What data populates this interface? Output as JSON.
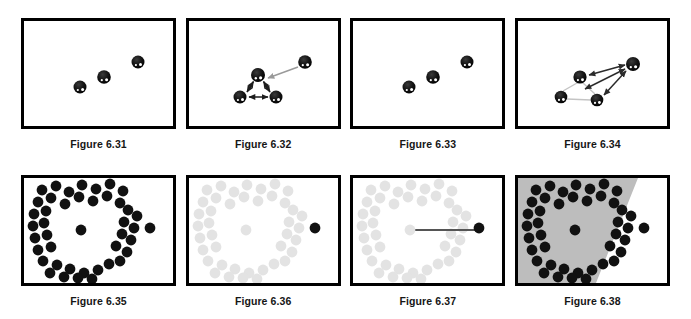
{
  "sheet": {
    "title": "Figures 6.31-6.38 sphere diagrams",
    "background_color": "#ffffff",
    "border_color": "#000000",
    "ball_color": "#111111",
    "faded_ball_color": "#e3e3e3",
    "gray_arrow_color": "#9a9a9a",
    "dark_arrow_color": "#2b2b2b",
    "shade_region_color": "#bdbdbd"
  },
  "rows": [
    {
      "name": "top-row",
      "panels": [
        {
          "id": "fig-631",
          "caption": "Figure 6.31",
          "description": "Three black spheres scattered, no connections",
          "balls": [
            {
              "cx": 56,
              "cy": 66,
              "r": 6.5,
              "shade": "dark"
            },
            {
              "cx": 80,
              "cy": 56,
              "r": 6.8,
              "shade": "dark"
            },
            {
              "cx": 114,
              "cy": 41,
              "r": 6.5,
              "shade": "dark"
            }
          ],
          "arrows": [],
          "lines": [],
          "shade_polygon": null
        },
        {
          "id": "fig-632",
          "caption": "Figure 6.32",
          "description": "Three spheres joined by double-headed arrows forming a triangle, a fourth sphere at upper right with a gray arrow pointing toward the triangle apex",
          "balls": [
            {
              "cx": 51,
              "cy": 76,
              "r": 6.5,
              "shade": "dark"
            },
            {
              "cx": 87,
              "cy": 76,
              "r": 6.5,
              "shade": "dark"
            },
            {
              "cx": 69,
              "cy": 54,
              "r": 7.0,
              "shade": "dark"
            },
            {
              "cx": 116,
              "cy": 41,
              "r": 6.8,
              "shade": "dark"
            }
          ],
          "arrows": [
            {
              "x1": 60,
              "y1": 76,
              "x2": 79,
              "y2": 76,
              "style": "double",
              "color": "dark"
            },
            {
              "x1": 58,
              "y1": 70,
              "x2": 64,
              "y2": 60,
              "style": "double",
              "color": "dark"
            },
            {
              "x1": 75,
              "y1": 60,
              "x2": 81,
              "y2": 70,
              "style": "double",
              "color": "dark"
            },
            {
              "x1": 109,
              "y1": 46,
              "x2": 79,
              "y2": 57,
              "style": "single",
              "color": "gray"
            }
          ],
          "lines": [],
          "shade_polygon": null
        },
        {
          "id": "fig-633",
          "caption": "Figure 6.33",
          "description": "Three black spheres scattered, no connections (same layout as 6.31)",
          "balls": [
            {
              "cx": 56,
              "cy": 66,
              "r": 6.5,
              "shade": "dark"
            },
            {
              "cx": 80,
              "cy": 56,
              "r": 6.8,
              "shade": "dark"
            },
            {
              "cx": 114,
              "cy": 41,
              "r": 6.5,
              "shade": "dark"
            }
          ],
          "arrows": [],
          "lines": [],
          "shade_polygon": null
        },
        {
          "id": "fig-634",
          "caption": "Figure 6.34",
          "description": "Four spheres: a light-gray triangle of three plus an upper-right sphere, with dark double-headed arrows from the upper-right sphere to each triangle member",
          "balls": [
            {
              "cx": 43,
              "cy": 76,
              "r": 6.3,
              "shade": "dark"
            },
            {
              "cx": 79,
              "cy": 79,
              "r": 6.3,
              "shade": "dark"
            },
            {
              "cx": 62,
              "cy": 56,
              "r": 6.6,
              "shade": "dark"
            },
            {
              "cx": 115,
              "cy": 43,
              "r": 7.0,
              "shade": "dark"
            }
          ],
          "arrows": [
            {
              "x1": 71,
              "y1": 54,
              "x2": 107,
              "y2": 44,
              "style": "double",
              "color": "dark"
            },
            {
              "x1": 67,
              "y1": 68,
              "x2": 107,
              "y2": 48,
              "style": "double",
              "color": "dark"
            },
            {
              "x1": 86,
              "y1": 74,
              "x2": 108,
              "y2": 50,
              "style": "double",
              "color": "dark"
            }
          ],
          "lines": [
            {
              "x1": 45,
              "y1": 70,
              "x2": 59,
              "y2": 62,
              "color": "gray"
            },
            {
              "x1": 49,
              "y1": 78,
              "x2": 73,
              "y2": 79,
              "color": "gray"
            },
            {
              "x1": 65,
              "y1": 62,
              "x2": 77,
              "y2": 73,
              "color": "gray"
            }
          ],
          "shade_polygon": null
        }
      ]
    },
    {
      "name": "bottom-row",
      "panels": [
        {
          "id": "fig-635",
          "caption": "Figure 6.35",
          "description": "Dense ring of black dots with one dot at the ring centre and one isolated dot outside to the right",
          "dot_set": "ring",
          "ring_shade": "dark",
          "center_shade": "dark",
          "outside_shade": "dark",
          "connector": null,
          "shade_polygon": null
        },
        {
          "id": "fig-636",
          "caption": "Figure 6.36",
          "description": "Same ring pattern faded to light gray except the isolated outside dot which stays black",
          "dot_set": "ring",
          "ring_shade": "faded",
          "center_shade": "faded",
          "outside_shade": "dark",
          "connector": null,
          "shade_polygon": null
        },
        {
          "id": "fig-637",
          "caption": "Figure 6.37",
          "description": "Faded ring pattern with a dark horizontal line joining the black outside dot to the faded centre dot",
          "dot_set": "ring",
          "ring_shade": "faded",
          "center_shade": "faded",
          "outside_shade": "dark",
          "connector": {
            "x1": 123,
            "y1": 52,
            "x2": 57,
            "y2": 52,
            "color": "#555555",
            "width": 2
          },
          "shade_polygon": null
        },
        {
          "id": "fig-638",
          "caption": "Figure 6.38",
          "description": "Ring of black dots over a gray shaded region whose diagonal boundary excludes the isolated outside dot",
          "dot_set": "ring",
          "ring_shade": "dark",
          "center_shade": "dark",
          "outside_shade": "dark",
          "connector": null,
          "shade_polygon": "0,0 120,0 78,105 0,105"
        }
      ]
    }
  ],
  "ring_layout": {
    "note": "Normalized dot positions in a 149x105 panel interior: annulus of dots, one centre dot, one isolated dot right of the ring",
    "ring_dots": [
      [
        18,
        12
      ],
      [
        32,
        8
      ],
      [
        45,
        14
      ],
      [
        58,
        7
      ],
      [
        72,
        11
      ],
      [
        86,
        6
      ],
      [
        99,
        13
      ],
      [
        14,
        24
      ],
      [
        27,
        20
      ],
      [
        41,
        26
      ],
      [
        55,
        19
      ],
      [
        69,
        23
      ],
      [
        83,
        18
      ],
      [
        96,
        25
      ],
      [
        10,
        36
      ],
      [
        22,
        33
      ],
      [
        104,
        32
      ],
      [
        113,
        38
      ],
      [
        9,
        48
      ],
      [
        20,
        45
      ],
      [
        100,
        44
      ],
      [
        110,
        50
      ],
      [
        11,
        60
      ],
      [
        23,
        57
      ],
      [
        98,
        56
      ],
      [
        107,
        62
      ],
      [
        14,
        72
      ],
      [
        27,
        69
      ],
      [
        92,
        68
      ],
      [
        103,
        74
      ],
      [
        19,
        83
      ],
      [
        33,
        87
      ],
      [
        46,
        91
      ],
      [
        60,
        95
      ],
      [
        74,
        92
      ],
      [
        85,
        86
      ],
      [
        96,
        83
      ],
      [
        26,
        95
      ],
      [
        40,
        99
      ],
      [
        54,
        100
      ],
      [
        68,
        101
      ]
    ],
    "center_dot": [
      57,
      52
    ],
    "outside_dot": [
      126,
      50
    ],
    "dot_radius": 5.4
  }
}
